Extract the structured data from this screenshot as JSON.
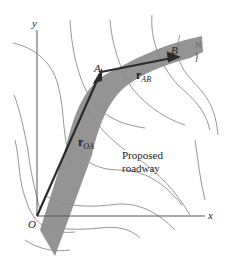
{
  "figure": {
    "axes": {
      "x_label": "x",
      "y_label": "y",
      "origin_label": "O"
    },
    "points": {
      "A": "A",
      "B": "B"
    },
    "vectors": {
      "r_OA": {
        "symbol": "r",
        "subscript": "OA"
      },
      "r_AB": {
        "symbol": "r",
        "subscript": "AB"
      }
    },
    "annotation": {
      "line1": "Proposed",
      "line2": "roadway"
    },
    "compass": {
      "label": "N"
    },
    "colors": {
      "road": "#8e8e8e",
      "vector": "#2b2b2b",
      "contour": "#8a8a8a",
      "axis": "#555555"
    }
  }
}
